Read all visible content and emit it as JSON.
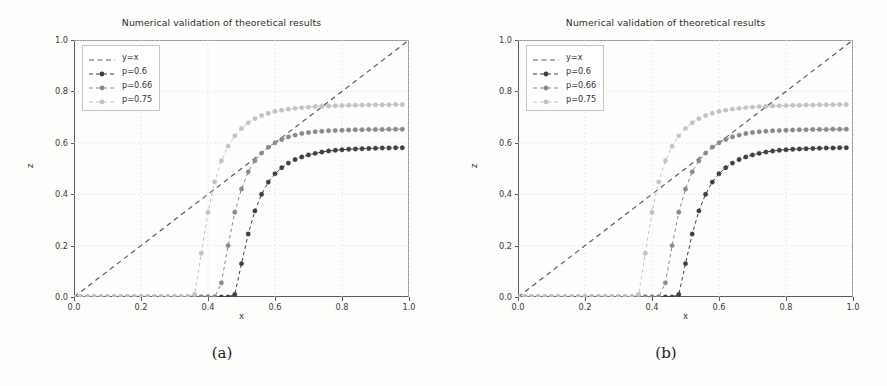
{
  "figure": {
    "caption_a": "(a)",
    "caption_b": "(b)",
    "background_color": "#fdfdfc"
  },
  "chart_data": {
    "type": "line",
    "title": "Numerical validation of theoretical results",
    "xlabel": "x",
    "ylabel": "z",
    "xlim": [
      0.0,
      1.0
    ],
    "ylim": [
      0.0,
      1.0
    ],
    "xticks": [
      "0.0",
      "0.2",
      "0.4",
      "0.6",
      "0.8",
      "1.0"
    ],
    "yticks": [
      "0.0",
      "0.2",
      "0.4",
      "0.6",
      "0.8",
      "1.0"
    ],
    "xtick_values": [
      0.0,
      0.2,
      0.4,
      0.6,
      0.8,
      1.0
    ],
    "ytick_values": [
      0.0,
      0.2,
      0.4,
      0.6,
      0.8,
      1.0
    ],
    "grid": true,
    "grid_style": "dotted",
    "legend_position": "upper left",
    "legend_entries": [
      "y=x",
      "p=0.6",
      "p=0.66",
      "p=0.75"
    ],
    "colors": {
      "y=x": "#5a5a5a",
      "p=0.6": "#3f3f3f",
      "p=0.66": "#8a8a8a",
      "p=0.75": "#c2c2c2",
      "axis": "#5c5c5c",
      "grid": "#dcdcdc"
    },
    "series": [
      {
        "name": "y=x",
        "style": "dashed",
        "marker": "none",
        "x": [
          0.0,
          1.0
        ],
        "y": [
          0.0,
          1.0
        ]
      },
      {
        "name": "p=0.6",
        "style": "dashed",
        "marker": "circle",
        "x": [
          0.0,
          0.02,
          0.04,
          0.06,
          0.08,
          0.1,
          0.12,
          0.14,
          0.16,
          0.18,
          0.2,
          0.22,
          0.24,
          0.26,
          0.28,
          0.3,
          0.32,
          0.34,
          0.36,
          0.38,
          0.4,
          0.42,
          0.44,
          0.46,
          0.48,
          0.5,
          0.52,
          0.54,
          0.56,
          0.58,
          0.6,
          0.62,
          0.64,
          0.66,
          0.68,
          0.7,
          0.72,
          0.74,
          0.76,
          0.78,
          0.8,
          0.82,
          0.84,
          0.86,
          0.88,
          0.9,
          0.92,
          0.94,
          0.96,
          0.98
        ],
        "y": [
          0.0,
          0.0,
          0.0,
          0.0,
          0.0,
          0.0,
          0.0,
          0.0,
          0.0,
          0.0,
          0.0,
          0.0,
          0.0,
          0.0,
          0.0,
          0.0,
          0.0,
          0.0,
          0.0,
          0.0,
          0.0,
          0.0,
          0.0,
          0.0,
          0.01,
          0.13,
          0.245,
          0.335,
          0.4,
          0.447,
          0.48,
          0.503,
          0.521,
          0.535,
          0.545,
          0.553,
          0.559,
          0.564,
          0.568,
          0.571,
          0.573,
          0.575,
          0.576,
          0.577,
          0.578,
          0.579,
          0.58,
          0.58,
          0.581,
          0.581
        ]
      },
      {
        "name": "p=0.66",
        "style": "dashed",
        "marker": "circle",
        "x": [
          0.0,
          0.02,
          0.04,
          0.06,
          0.08,
          0.1,
          0.12,
          0.14,
          0.16,
          0.18,
          0.2,
          0.22,
          0.24,
          0.26,
          0.28,
          0.3,
          0.32,
          0.34,
          0.36,
          0.38,
          0.4,
          0.42,
          0.44,
          0.46,
          0.48,
          0.5,
          0.52,
          0.54,
          0.56,
          0.58,
          0.6,
          0.62,
          0.64,
          0.66,
          0.68,
          0.7,
          0.72,
          0.74,
          0.76,
          0.78,
          0.8,
          0.82,
          0.84,
          0.86,
          0.88,
          0.9,
          0.92,
          0.94,
          0.96,
          0.98
        ],
        "y": [
          0.0,
          0.0,
          0.0,
          0.0,
          0.0,
          0.0,
          0.0,
          0.0,
          0.0,
          0.0,
          0.0,
          0.0,
          0.0,
          0.0,
          0.0,
          0.0,
          0.0,
          0.0,
          0.0,
          0.0,
          0.0,
          0.0,
          0.055,
          0.2,
          0.33,
          0.42,
          0.487,
          0.53,
          0.56,
          0.583,
          0.6,
          0.613,
          0.623,
          0.63,
          0.636,
          0.64,
          0.643,
          0.645,
          0.647,
          0.648,
          0.649,
          0.65,
          0.651,
          0.651,
          0.652,
          0.652,
          0.652,
          0.653,
          0.653,
          0.653
        ]
      },
      {
        "name": "p=0.75",
        "style": "dashed",
        "marker": "circle",
        "x": [
          0.0,
          0.02,
          0.04,
          0.06,
          0.08,
          0.1,
          0.12,
          0.14,
          0.16,
          0.18,
          0.2,
          0.22,
          0.24,
          0.26,
          0.28,
          0.3,
          0.32,
          0.34,
          0.36,
          0.38,
          0.4,
          0.42,
          0.44,
          0.46,
          0.48,
          0.5,
          0.52,
          0.54,
          0.56,
          0.58,
          0.6,
          0.62,
          0.64,
          0.66,
          0.68,
          0.7,
          0.72,
          0.74,
          0.76,
          0.78,
          0.8,
          0.82,
          0.84,
          0.86,
          0.88,
          0.9,
          0.92,
          0.94,
          0.96,
          0.98
        ],
        "y": [
          0.0,
          0.0,
          0.0,
          0.0,
          0.0,
          0.0,
          0.0,
          0.0,
          0.0,
          0.0,
          0.0,
          0.0,
          0.0,
          0.0,
          0.0,
          0.0,
          0.0,
          0.0,
          0.01,
          0.17,
          0.33,
          0.448,
          0.53,
          0.587,
          0.627,
          0.656,
          0.678,
          0.694,
          0.706,
          0.715,
          0.722,
          0.727,
          0.731,
          0.734,
          0.737,
          0.739,
          0.741,
          0.742,
          0.743,
          0.744,
          0.745,
          0.746,
          0.746,
          0.747,
          0.747,
          0.748,
          0.748,
          0.748,
          0.749,
          0.749
        ]
      }
    ]
  }
}
